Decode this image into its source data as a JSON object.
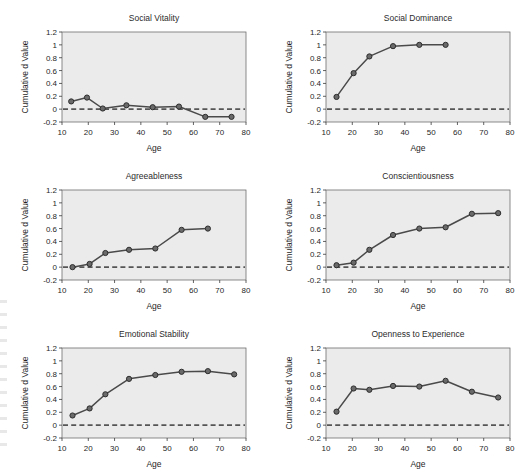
{
  "figure": {
    "background_color": "#ffffff",
    "panel_background_color": "#ebebeb",
    "line_color": "#4a4a4a",
    "marker_color": "#6a6a6a",
    "zero_line_color": "#555555",
    "rows": 3,
    "columns": 2
  },
  "chart_data": [
    {
      "type": "line",
      "title": "Social Vitality",
      "xlabel": "Age",
      "ylabel": "Cumulative d Value",
      "xlim": [
        10,
        80
      ],
      "ylim": [
        -0.2,
        1.2
      ],
      "xticks": [
        10,
        20,
        30,
        40,
        50,
        60,
        70,
        80
      ],
      "yticks": [
        -0.2,
        0,
        0.2,
        0.4,
        0.6,
        0.8,
        1,
        1.2
      ],
      "ytick_labels": [
        "-0.2",
        "0",
        "0.2",
        "0.4",
        "0.6",
        "0.8",
        "1",
        "1.2"
      ],
      "grid": false,
      "legend": "none",
      "reference_line": 0,
      "x": [
        13.5,
        19.5,
        25.5,
        34.5,
        44.5,
        54.5,
        64.5,
        74.5
      ],
      "values": [
        0.12,
        0.18,
        0.01,
        0.06,
        0.03,
        0.04,
        -0.12,
        -0.12
      ]
    },
    {
      "type": "line",
      "title": "Social Dominance",
      "xlabel": "Age",
      "ylabel": "Cumulative d Value",
      "xlim": [
        10,
        80
      ],
      "ylim": [
        -0.2,
        1.2
      ],
      "xticks": [
        10,
        20,
        30,
        40,
        50,
        60,
        70,
        80
      ],
      "yticks": [
        -0.2,
        0,
        0.2,
        0.4,
        0.6,
        0.8,
        1,
        1.2
      ],
      "ytick_labels": [
        "-0.2",
        "0",
        "0.2",
        "0.4",
        "0.6",
        "0.8",
        "1",
        "1.2"
      ],
      "grid": false,
      "legend": "none",
      "reference_line": 0,
      "x": [
        14,
        20.5,
        26.5,
        35.5,
        45.5,
        55.5
      ],
      "values": [
        0.19,
        0.56,
        0.82,
        0.98,
        1.0,
        1.0
      ]
    },
    {
      "type": "line",
      "title": "Agreeableness",
      "xlabel": "Age",
      "ylabel": "Cumulative d Value",
      "xlim": [
        10,
        80
      ],
      "ylim": [
        -0.2,
        1.2
      ],
      "xticks": [
        10,
        20,
        30,
        40,
        50,
        60,
        70,
        80
      ],
      "yticks": [
        -0.2,
        0,
        0.2,
        0.4,
        0.6,
        0.8,
        1,
        1.2
      ],
      "ytick_labels": [
        "-0.2",
        "0",
        "0.2",
        "0.4",
        "0.6",
        "0.8",
        "1",
        "1.2"
      ],
      "grid": false,
      "legend": "none",
      "reference_line": 0,
      "x": [
        14,
        20.5,
        26.5,
        35.5,
        45.5,
        55.5,
        65.5
      ],
      "values": [
        0.0,
        0.05,
        0.22,
        0.27,
        0.29,
        0.58,
        0.6
      ]
    },
    {
      "type": "line",
      "title": "Conscientiousness",
      "xlabel": "Age",
      "ylabel": "Cumulative d Value",
      "xlim": [
        10,
        80
      ],
      "ylim": [
        -0.2,
        1.2
      ],
      "xticks": [
        10,
        20,
        30,
        40,
        50,
        60,
        70,
        80
      ],
      "yticks": [
        -0.2,
        0,
        0.2,
        0.4,
        0.6,
        0.8,
        1,
        1.2
      ],
      "ytick_labels": [
        "-0.2",
        "0",
        "0.2",
        "0.4",
        "0.6",
        "0.8",
        "1",
        "1.2"
      ],
      "grid": false,
      "legend": "none",
      "reference_line": 0,
      "x": [
        14,
        20.5,
        26.5,
        35.5,
        45.5,
        55.5,
        65.5,
        75.5
      ],
      "values": [
        0.03,
        0.07,
        0.27,
        0.5,
        0.6,
        0.62,
        0.83,
        0.84
      ]
    },
    {
      "type": "line",
      "title": "Emotional Stability",
      "xlabel": "Age",
      "ylabel": "Cumulative d Value",
      "xlim": [
        10,
        80
      ],
      "ylim": [
        -0.2,
        1.2
      ],
      "xticks": [
        10,
        20,
        30,
        40,
        50,
        60,
        70,
        80
      ],
      "yticks": [
        -0.2,
        0,
        0.2,
        0.4,
        0.6,
        0.8,
        1,
        1.2
      ],
      "ytick_labels": [
        "-0.2",
        "0",
        "0.2",
        "0.4",
        "0.6",
        "0.8",
        "1",
        "1.2"
      ],
      "grid": false,
      "legend": "none",
      "reference_line": 0,
      "x": [
        14,
        20.5,
        26.5,
        35.5,
        45.5,
        55.5,
        65.5,
        75.5
      ],
      "values": [
        0.15,
        0.26,
        0.48,
        0.72,
        0.78,
        0.83,
        0.84,
        0.79
      ]
    },
    {
      "type": "line",
      "title": "Openness to Experience",
      "xlabel": "Age",
      "ylabel": "Cumulative d Value",
      "xlim": [
        10,
        80
      ],
      "ylim": [
        -0.2,
        1.2
      ],
      "xticks": [
        10,
        20,
        30,
        40,
        50,
        60,
        70,
        80
      ],
      "yticks": [
        -0.2,
        0,
        0.2,
        0.4,
        0.6,
        0.8,
        1,
        1.2
      ],
      "ytick_labels": [
        "-0.2",
        "0",
        "0.2",
        "0.4",
        "0.6",
        "0.8",
        "1",
        "1.2"
      ],
      "grid": false,
      "legend": "none",
      "reference_line": 0,
      "x": [
        14,
        20.5,
        26.5,
        35.5,
        45.5,
        55.5,
        65.5,
        75.5
      ],
      "values": [
        0.21,
        0.57,
        0.55,
        0.61,
        0.6,
        0.69,
        0.52,
        0.43
      ]
    }
  ]
}
